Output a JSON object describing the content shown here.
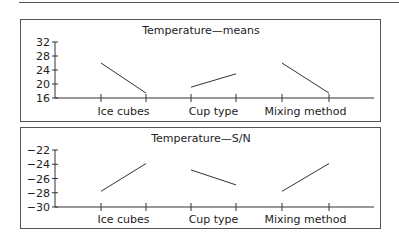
{
  "chart_data": [
    {
      "type": "line",
      "title": "Temperature—means",
      "xlabel": "",
      "ylabel": "",
      "yticks": [
        16,
        20,
        24,
        28,
        32
      ],
      "ytick_labels": [
        "16",
        "20",
        "24",
        "28",
        "32"
      ],
      "ylim": [
        16,
        32
      ],
      "grid": false,
      "legend": null,
      "categories": [
        "Ice cubes",
        "Cup type",
        "Mixing method"
      ],
      "series": [
        {
          "name": "Ice cubes",
          "levels": [
            1,
            2
          ],
          "values": [
            26.0,
            17.4
          ]
        },
        {
          "name": "Cup type",
          "levels": [
            1,
            2
          ],
          "values": [
            19.1,
            22.9
          ]
        },
        {
          "name": "Mixing method",
          "levels": [
            1,
            2
          ],
          "values": [
            26.0,
            17.4
          ]
        }
      ]
    },
    {
      "type": "line",
      "title": "Temperature—S/N",
      "xlabel": "",
      "ylabel": "",
      "yticks": [
        -30,
        -28,
        -26,
        -24,
        -22
      ],
      "ytick_labels": [
        "−30",
        "−28",
        "−26",
        "−24",
        "−22"
      ],
      "ylim": [
        -30,
        -22
      ],
      "grid": false,
      "legend": null,
      "categories": [
        "Ice cubes",
        "Cup type",
        "Mixing method"
      ],
      "series": [
        {
          "name": "Ice cubes",
          "levels": [
            1,
            2
          ],
          "values": [
            -27.8,
            -23.9
          ]
        },
        {
          "name": "Cup type",
          "levels": [
            1,
            2
          ],
          "values": [
            -24.8,
            -26.9
          ]
        },
        {
          "name": "Mixing method",
          "levels": [
            1,
            2
          ],
          "values": [
            -27.8,
            -23.9
          ]
        }
      ]
    }
  ]
}
